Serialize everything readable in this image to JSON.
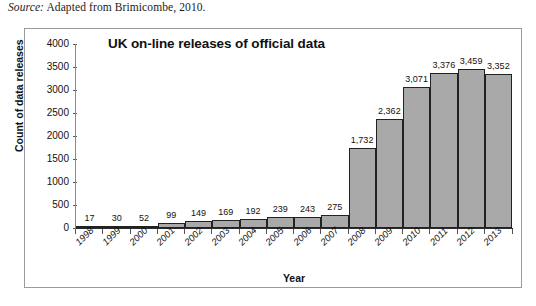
{
  "caption": {
    "source_word": "Source:",
    "source_text": " Adapted from Brimicombe, 2010."
  },
  "chart_data": {
    "type": "bar",
    "title": "UK on-line releases of official data",
    "xlabel": "Year",
    "ylabel": "Count of data releases",
    "categories": [
      "1998",
      "1999",
      "2000",
      "2001",
      "2002",
      "2003",
      "2004",
      "2005",
      "2006",
      "2007",
      "2008",
      "2009",
      "2010",
      "2011",
      "2012",
      "2013"
    ],
    "values": [
      17,
      30,
      52,
      99,
      149,
      169,
      192,
      239,
      243,
      275,
      1732,
      2362,
      3071,
      3376,
      3459,
      3352
    ],
    "value_labels": [
      "17",
      "30",
      "52",
      "99",
      "149",
      "169",
      "192",
      "239",
      "243",
      "275",
      "1,732",
      "2,362",
      "3,071",
      "3,376",
      "3,459",
      "3,352"
    ],
    "ylim": [
      0,
      4000
    ],
    "yticks": [
      4000,
      3500,
      3000,
      2500,
      2000,
      1500,
      1000,
      500,
      0
    ],
    "ytick_labels": [
      "4000",
      "3500",
      "3000",
      "2500",
      "2000",
      "1500",
      "1000",
      "500",
      "0"
    ],
    "grid": false,
    "legend": "none",
    "bar_fill_color": "#a9a9a9",
    "bar_border_color": "#222222",
    "text_color": "#111111"
  }
}
